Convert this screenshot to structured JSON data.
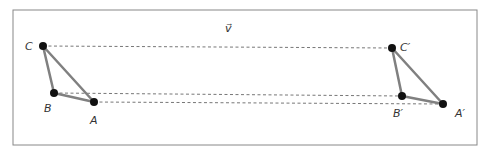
{
  "diagram": {
    "vector_label": "v⃗",
    "colors": {
      "frame": "#888888",
      "triangle_edge": "#808080",
      "point": "#111111",
      "dash": "#777777",
      "label": "#333333"
    },
    "original": {
      "points": [
        {
          "name": "A",
          "label": "A",
          "x": 94,
          "y": 102
        },
        {
          "name": "B",
          "label": "B",
          "x": 54,
          "y": 93
        },
        {
          "name": "C",
          "label": "C",
          "x": 43,
          "y": 46
        }
      ]
    },
    "image": {
      "points": [
        {
          "name": "A'",
          "label": "A′",
          "x": 443,
          "y": 104
        },
        {
          "name": "B'",
          "label": "B′",
          "x": 402,
          "y": 96
        },
        {
          "name": "C'",
          "label": "C′",
          "x": 392,
          "y": 48
        }
      ]
    }
  }
}
